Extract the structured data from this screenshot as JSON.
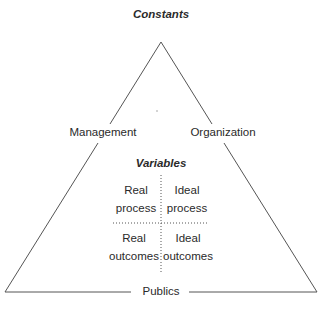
{
  "diagram": {
    "title": "Constants",
    "vertices": {
      "left_label": "Management",
      "right_label": "Organization",
      "base_label": "Publics"
    },
    "inner": {
      "heading": "Variables",
      "quadrants": [
        {
          "line1": "Real",
          "line2": "process"
        },
        {
          "line1": "Ideal",
          "line2": "process"
        },
        {
          "line1": "Real",
          "line2": "outcomes"
        },
        {
          "line1": "Ideal",
          "line2": "outcomes"
        }
      ]
    },
    "colors": {
      "stroke": "#555555",
      "text": "#2a2a2a",
      "background": "#ffffff"
    }
  }
}
